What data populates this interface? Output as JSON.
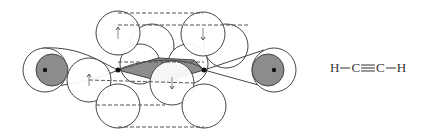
{
  "diagram": {
    "colors": {
      "stroke": "#444444",
      "shade": "#8c8c8c",
      "dot": "#111111",
      "dash": "#555555",
      "arrow": "#888888"
    },
    "hydrogen_orbitals": [
      {
        "name": "left-hydrogen",
        "cx": 45,
        "cy": 70,
        "r": 22,
        "shade_cx": 52,
        "shade_cy": 70,
        "shade_r": 16,
        "nucleus_x": 45,
        "nucleus_y": 70
      },
      {
        "name": "right-hydrogen",
        "cx": 274,
        "cy": 70,
        "r": 22,
        "shade_cx": 268,
        "shade_cy": 70,
        "shade_r": 16,
        "nucleus_x": 274,
        "nucleus_y": 70
      }
    ],
    "carbon_nuclei": [
      {
        "name": "left-carbon",
        "x": 118,
        "y": 70
      },
      {
        "name": "right-carbon",
        "x": 204,
        "y": 70
      }
    ],
    "p_orbital_lobes": [
      {
        "name": "upper-left-lobe",
        "cx": 118,
        "cy": 33,
        "r": 22,
        "spin": "up"
      },
      {
        "name": "upper-right-lobe",
        "cx": 203,
        "cy": 34,
        "r": 22,
        "spin": "down"
      },
      {
        "name": "back-upper-left-lobe",
        "cx": 152,
        "cy": 46,
        "r": 22,
        "spin": ""
      },
      {
        "name": "back-upper-right-lobe",
        "cx": 226,
        "cy": 46,
        "r": 22,
        "spin": ""
      },
      {
        "name": "back-mid-left-lobe",
        "cx": 140,
        "cy": 64,
        "r": 20,
        "spin": ""
      },
      {
        "name": "back-mid-right-lobe",
        "cx": 188,
        "cy": 64,
        "r": 20,
        "spin": ""
      },
      {
        "name": "middle-left-lobe",
        "cx": 89,
        "cy": 80,
        "r": 22,
        "spin": "up"
      },
      {
        "name": "middle-right-lobe",
        "cx": 172,
        "cy": 83,
        "r": 22,
        "spin": "down"
      },
      {
        "name": "lower-left-lobe",
        "cx": 118,
        "cy": 106,
        "r": 22,
        "spin": ""
      },
      {
        "name": "lower-right-lobe",
        "cx": 204,
        "cy": 106,
        "r": 22,
        "spin": ""
      }
    ],
    "dashed_lines": [
      {
        "x1": 118,
        "y1": 13,
        "x2": 203,
        "y2": 13
      },
      {
        "x1": 118,
        "y1": 25,
        "x2": 250,
        "y2": 25
      },
      {
        "x1": 118,
        "y1": 62,
        "x2": 204,
        "y2": 62
      },
      {
        "x1": 89,
        "y1": 80,
        "x2": 194,
        "y2": 83
      },
      {
        "x1": 96,
        "y1": 105,
        "x2": 165,
        "y2": 105
      },
      {
        "x1": 118,
        "y1": 127,
        "x2": 204,
        "y2": 127
      }
    ],
    "spin_arrows": [
      {
        "x": 118,
        "y": 33,
        "dir": "up"
      },
      {
        "x": 203,
        "y": 34,
        "dir": "down"
      },
      {
        "x": 89,
        "y": 80,
        "dir": "up"
      },
      {
        "x": 172,
        "y": 83,
        "dir": "down"
      }
    ],
    "formula": {
      "h_left": "H",
      "c_left": "C",
      "c_right": "C",
      "h_right": "H"
    }
  }
}
